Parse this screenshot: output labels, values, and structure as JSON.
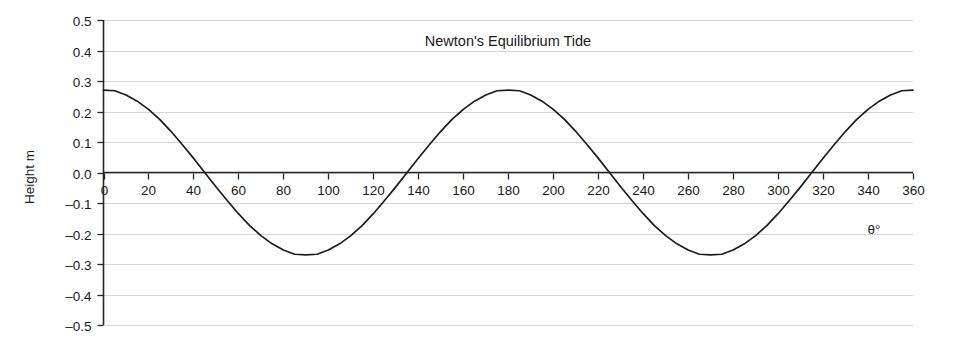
{
  "chart_data": {
    "type": "line",
    "title": "Newton's Equilibrium Tide",
    "xlabel": "θ°",
    "ylabel": "Height m",
    "xlim": [
      0,
      360
    ],
    "ylim": [
      -0.5,
      0.5
    ],
    "grid": true,
    "legend": null,
    "xticks": [
      0,
      20,
      40,
      60,
      80,
      100,
      120,
      140,
      160,
      180,
      200,
      220,
      240,
      260,
      280,
      300,
      320,
      340,
      360
    ],
    "xtick_labels": [
      "0",
      "20",
      "40",
      "60",
      "80",
      "100",
      "120",
      "140",
      "160",
      "180",
      "200",
      "220",
      "240",
      "260",
      "280",
      "300",
      "320",
      "340",
      "360"
    ],
    "yticks": [
      0.5,
      0.4,
      0.3,
      0.2,
      0.1,
      0.0,
      -0.1,
      -0.2,
      -0.3,
      -0.4,
      -0.5
    ],
    "ytick_labels": [
      "0.5",
      "0.4",
      "0.3",
      "0.2",
      "0.1",
      "0.0",
      "–0.1",
      "–0.2",
      "–0.3",
      "–0.4",
      "–0.5"
    ],
    "series": [
      {
        "name": "Equilibrium tide height",
        "amplitude": 0.27,
        "period_deg": 180,
        "x": [
          0,
          5,
          10,
          15,
          20,
          25,
          30,
          35,
          40,
          45,
          50,
          55,
          60,
          65,
          70,
          75,
          80,
          85,
          90,
          95,
          100,
          105,
          110,
          115,
          120,
          125,
          130,
          135,
          140,
          145,
          150,
          155,
          160,
          165,
          170,
          175,
          180,
          185,
          190,
          195,
          200,
          205,
          210,
          215,
          220,
          225,
          230,
          235,
          240,
          245,
          250,
          255,
          260,
          265,
          270,
          275,
          280,
          285,
          290,
          295,
          300,
          305,
          310,
          315,
          320,
          325,
          330,
          335,
          340,
          345,
          350,
          355,
          360
        ],
        "y": [
          0.27,
          0.268,
          0.254,
          0.234,
          0.207,
          0.174,
          0.135,
          0.092,
          0.047,
          0.0,
          -0.047,
          -0.092,
          -0.135,
          -0.174,
          -0.207,
          -0.234,
          -0.254,
          -0.268,
          -0.27,
          -0.268,
          -0.254,
          -0.234,
          -0.207,
          -0.174,
          -0.135,
          -0.092,
          -0.047,
          0.0,
          0.047,
          0.092,
          0.135,
          0.174,
          0.207,
          0.234,
          0.254,
          0.268,
          0.27,
          0.268,
          0.254,
          0.234,
          0.207,
          0.174,
          0.135,
          0.092,
          0.047,
          0.0,
          -0.047,
          -0.092,
          -0.135,
          -0.174,
          -0.207,
          -0.234,
          -0.254,
          -0.268,
          -0.27,
          -0.268,
          -0.254,
          -0.234,
          -0.207,
          -0.174,
          -0.135,
          -0.092,
          -0.047,
          0.0,
          0.047,
          0.092,
          0.135,
          0.174,
          0.207,
          0.234,
          0.254,
          0.268,
          0.27
        ]
      }
    ],
    "colors": {
      "curve": "#1c1c1c",
      "grid": "#d6d6d6",
      "axis": "#262626",
      "text": "#1a1a1a",
      "background": "#ffffff"
    }
  }
}
